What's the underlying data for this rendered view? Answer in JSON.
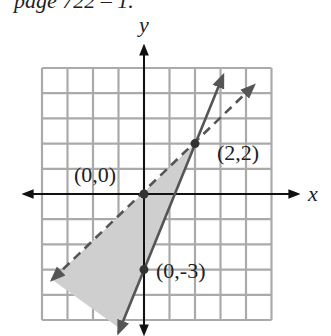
{
  "caption": "page 722 – 1.",
  "chart_data": {
    "type": "line",
    "title": "",
    "xlabel": "x",
    "ylabel": "y",
    "xlim": [
      -4,
      5
    ],
    "ylim": [
      -5,
      5
    ],
    "grid": true,
    "series": [
      {
        "name": "y = (5/2)x - 3",
        "style": "solid",
        "points": [
          [
            -1,
            -5.5
          ],
          [
            0,
            -3
          ],
          [
            2,
            2
          ],
          [
            3.1,
            4.7
          ]
        ]
      },
      {
        "name": "y = x",
        "style": "dashed",
        "points": [
          [
            -3.6,
            -3.4
          ],
          [
            0,
            0
          ],
          [
            2,
            2
          ],
          [
            4.3,
            4.3
          ]
        ]
      }
    ],
    "shaded_region": "between y = x (above) and y = (5/2)x - 3, for x < 2",
    "points": [
      {
        "label": "(0,0)",
        "x": 0,
        "y": 0
      },
      {
        "label": "(2,2)",
        "x": 2,
        "y": 2
      },
      {
        "label": "(0,-3)",
        "x": 0,
        "y": -3
      }
    ]
  },
  "colors": {
    "grid": "#aaaaaa",
    "axis": "#111111",
    "line": "#555555",
    "shade": "#cfcfcf"
  }
}
